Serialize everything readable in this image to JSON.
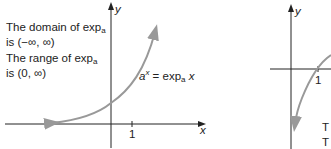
{
  "left_graph": {
    "domain_line1": "The domain of exp",
    "domain_sub": "a",
    "domain_line2": "is (−∞, ∞)",
    "range_line1": "The range of exp",
    "range_sub": "a",
    "range_line2": "is (0, ∞)",
    "curve_label_lhs": "a",
    "curve_label_sup": "x",
    "curve_label_rhs": " = exp",
    "curve_label_sub": "a",
    "curve_label_var": " x",
    "y_axis_label": "y",
    "x_axis_label": "x",
    "tick_label": "1"
  },
  "right_graph": {
    "y_axis_label": "y",
    "tick_label": "1",
    "text_line1": "T",
    "text_line2": "T"
  },
  "colors": {
    "curve": "#999999",
    "axis": "#222222"
  }
}
